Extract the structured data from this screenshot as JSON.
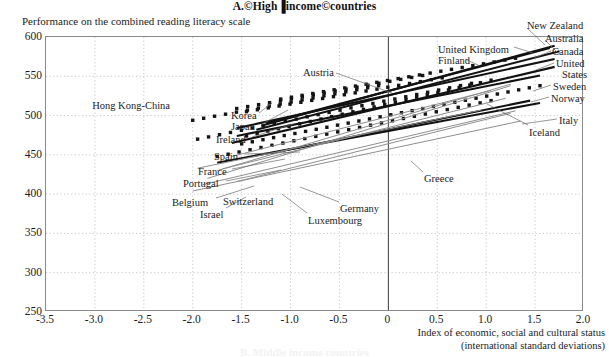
{
  "panel": {
    "title": "A.©High▐income©countries",
    "y_axis_caption": "Performance on the combined reading literacy scale",
    "x_axis_caption_line1": "Index of economic, social and cultural status",
    "x_axis_caption_line2": "(international standard deviations)",
    "next_panel_ghost": "B. Middle income countries"
  },
  "chart_data": {
    "type": "line",
    "title": "A.©High▐income©countries",
    "xlabel": "Index of economic, social and cultural status (international standard deviations)",
    "ylabel": "Performance on the combined reading literacy scale",
    "xlim": [
      -3.5,
      2.0
    ],
    "ylim": [
      250,
      600
    ],
    "xticks": [
      "-3.5",
      "-3.0",
      "-2.5",
      "-2.0",
      "-1.5",
      "-1.0",
      "-0.5",
      "0",
      "0.5",
      "1.0",
      "1.5",
      "2.0"
    ],
    "xtick_values": [
      -3.5,
      -3.0,
      -2.5,
      -2.0,
      -1.5,
      -1.0,
      -0.5,
      0,
      0.5,
      1.0,
      1.5,
      2.0
    ],
    "yticks": [
      "250",
      "300",
      "350",
      "400",
      "450",
      "500",
      "550",
      "600"
    ],
    "ytick_values": [
      250,
      300,
      350,
      400,
      450,
      500,
      550,
      600
    ],
    "grid": "dotted",
    "legend": "inline-annotations",
    "zero_reference_line_x": 0,
    "series": [
      {
        "name": "Hong Kong-China",
        "style": "dotted",
        "label_side": "left",
        "x": [
          -2.0,
          -0.1
        ],
        "y": [
          494,
          538
        ]
      },
      {
        "name": "Korea",
        "style": "dotted",
        "label_side": "left",
        "x": [
          -1.55,
          0.35
        ],
        "y": [
          509,
          551
        ]
      },
      {
        "name": "Japan",
        "style": "dotted",
        "label_side": "left",
        "x": [
          -1.45,
          0.55
        ],
        "y": [
          505,
          548
        ]
      },
      {
        "name": "Finland",
        "style": "dotted",
        "label_side": "mid",
        "x": [
          -1.1,
          1.3
        ],
        "y": [
          521,
          573
        ]
      },
      {
        "name": "Austria",
        "style": "dotted",
        "label_side": "mid",
        "x": [
          -1.95,
          0.85
        ],
        "y": [
          470,
          541
        ]
      },
      {
        "name": "Ireland",
        "style": "dotted",
        "label_side": "left",
        "x": [
          -1.45,
          1.05
        ],
        "y": [
          474,
          545
        ]
      },
      {
        "name": "Spain",
        "style": "dotted",
        "label_side": "left",
        "x": [
          -1.75,
          1.05
        ],
        "y": [
          448,
          519
        ]
      },
      {
        "name": "United Kingdom",
        "style": "solid",
        "label_side": "mid",
        "x": [
          -1.25,
          1.65
        ],
        "y": [
          490,
          586
        ]
      },
      {
        "name": "New Zealand",
        "style": "solid",
        "label_side": "right",
        "x": [
          -1.3,
          1.7
        ],
        "y": [
          487,
          589
        ]
      },
      {
        "name": "Australia",
        "style": "solid",
        "label_side": "right",
        "x": [
          -1.35,
          1.75
        ],
        "y": [
          482,
          582
        ]
      },
      {
        "name": "Canada",
        "style": "solid",
        "label_side": "right",
        "x": [
          -1.55,
          1.7
        ],
        "y": [
          484,
          572
        ]
      },
      {
        "name": "United States",
        "style": "solid",
        "label_side": "right",
        "x": [
          -1.6,
          1.7
        ],
        "y": [
          465,
          562
        ]
      },
      {
        "name": "Sweden",
        "style": "solid",
        "label_side": "right",
        "x": [
          -1.55,
          1.55
        ],
        "y": [
          474,
          551
        ]
      },
      {
        "name": "Norway",
        "style": "dotted",
        "label_side": "right",
        "x": [
          -1.5,
          1.55
        ],
        "y": [
          464,
          538
        ]
      },
      {
        "name": "Italy",
        "style": "solid",
        "label_side": "right",
        "x": [
          -1.75,
          1.55
        ],
        "y": [
          440,
          516
        ]
      },
      {
        "name": "Iceland",
        "style": "solid",
        "label_side": "right",
        "x": [
          -1.2,
          1.45
        ],
        "y": [
          452,
          519
        ]
      },
      {
        "name": "France",
        "style": "grey",
        "label_side": "left",
        "x": [
          -1.6,
          1.05
        ],
        "y": [
          448,
          532
        ]
      },
      {
        "name": "Portugal",
        "style": "grey",
        "label_side": "left",
        "x": [
          -1.95,
          0.95
        ],
        "y": [
          433,
          507
        ]
      },
      {
        "name": "Belgium",
        "style": "grey",
        "label_side": "left",
        "x": [
          -1.75,
          1.25
        ],
        "y": [
          430,
          540
        ]
      },
      {
        "name": "Switzerland",
        "style": "grey",
        "label_side": "mid",
        "x": [
          -1.7,
          1.2
        ],
        "y": [
          432,
          522
        ]
      },
      {
        "name": "Israel",
        "style": "grey",
        "label_side": "mid",
        "x": [
          -1.55,
          1.25
        ],
        "y": [
          416,
          503
        ]
      },
      {
        "name": "Germany",
        "style": "grey",
        "label_side": "mid",
        "x": [
          -1.85,
          1.25
        ],
        "y": [
          420,
          538
        ]
      },
      {
        "name": "Luxembourg",
        "style": "grey",
        "label_side": "mid",
        "x": [
          -1.9,
          1.3
        ],
        "y": [
          412,
          506
        ]
      },
      {
        "name": "Greece",
        "style": "grey",
        "label_side": "mid",
        "x": [
          -2.0,
          1.35
        ],
        "y": [
          404,
          493
        ]
      }
    ],
    "annotations": [
      {
        "label": "New Zealand",
        "x": 527,
        "y": 20,
        "side": "r",
        "lx1": 527,
        "ly1": 28,
        "lx2": 545,
        "ly2": 45
      },
      {
        "label": "Australia",
        "x": 545,
        "y": 33,
        "side": "r",
        "lx1": 545,
        "ly1": 40,
        "lx2": 557,
        "ly2": 52
      },
      {
        "label": "United Kingdom",
        "x": 438,
        "y": 44,
        "side": "r",
        "lx1": 514,
        "ly1": 47,
        "lx2": 533,
        "ly2": 53
      },
      {
        "label": "Canada",
        "x": 552,
        "y": 46,
        "side": "r",
        "lx1": 551,
        "ly1": 51,
        "lx2": 534,
        "ly2": 58
      },
      {
        "label": "Finland",
        "x": 438,
        "y": 55,
        "side": "r",
        "lx1": 465,
        "ly1": 59,
        "lx2": 480,
        "ly2": 66
      },
      {
        "label": "United",
        "x": 556,
        "y": 58,
        "side": "r",
        "lx1": 554,
        "ly1": 63,
        "lx2": 536,
        "ly2": 70
      },
      {
        "label": "States",
        "x": 562,
        "y": 69,
        "side": "r",
        "lx1": 0,
        "ly1": 0,
        "lx2": 0,
        "ly2": 0
      },
      {
        "label": "Austria",
        "x": 303,
        "y": 67,
        "side": "r",
        "lx1": 336,
        "ly1": 73,
        "lx2": 392,
        "ly2": 93
      },
      {
        "label": "Sweden",
        "x": 553,
        "y": 81,
        "side": "r",
        "lx1": 551,
        "ly1": 85,
        "lx2": 533,
        "ly2": 91
      },
      {
        "label": "Norway",
        "x": 551,
        "y": 93,
        "side": "r",
        "lx1": 549,
        "ly1": 97,
        "lx2": 531,
        "ly2": 102
      },
      {
        "label": "Hong Kong-China",
        "x": 170,
        "y": 100,
        "side": "l",
        "lx1": 0,
        "ly1": 0,
        "lx2": 0,
        "ly2": 0
      },
      {
        "label": "Italy",
        "x": 559,
        "y": 115,
        "side": "r",
        "lx1": 557,
        "ly1": 119,
        "lx2": 522,
        "ly2": 124
      },
      {
        "label": "Korea",
        "x": 231,
        "y": 110,
        "side": "r",
        "lx1": 259,
        "ly1": 113,
        "lx2": 272,
        "ly2": 103
      },
      {
        "label": "Japan",
        "x": 231,
        "y": 121,
        "side": "r",
        "lx1": 262,
        "ly1": 124,
        "lx2": 288,
        "ly2": 110
      },
      {
        "label": "Iceland",
        "x": 529,
        "y": 127,
        "side": "r",
        "lx1": 528,
        "ly1": 125,
        "lx2": 487,
        "ly2": 104
      },
      {
        "label": "Ireland",
        "x": 216,
        "y": 134,
        "side": "r",
        "lx1": 252,
        "ly1": 137,
        "lx2": 293,
        "ly2": 124
      },
      {
        "label": "Spain",
        "x": 214,
        "y": 151,
        "side": "r",
        "lx1": 245,
        "ly1": 154,
        "lx2": 300,
        "ly2": 152
      },
      {
        "label": "Greece",
        "x": 424,
        "y": 173,
        "side": "r",
        "lx1": 423,
        "ly1": 172,
        "lx2": 411,
        "ly2": 161
      },
      {
        "label": "France",
        "x": 198,
        "y": 166,
        "side": "r",
        "lx1": 232,
        "ly1": 169,
        "lx2": 285,
        "ly2": 159
      },
      {
        "label": "Portugal",
        "x": 183,
        "y": 178,
        "side": "r",
        "lx1": 226,
        "ly1": 181,
        "lx2": 281,
        "ly2": 170
      },
      {
        "label": "Belgium",
        "x": 172,
        "y": 197,
        "side": "r",
        "lx1": 216,
        "ly1": 198,
        "lx2": 254,
        "ly2": 186
      },
      {
        "label": "Switzerland",
        "x": 223,
        "y": 196,
        "side": "r",
        "lx1": 0,
        "ly1": 0,
        "lx2": 0,
        "ly2": 0
      },
      {
        "label": "Germany",
        "x": 340,
        "y": 203,
        "side": "r",
        "lx1": 339,
        "ly1": 202,
        "lx2": 300,
        "ly2": 187
      },
      {
        "label": "Israel",
        "x": 200,
        "y": 209,
        "side": "r",
        "lx1": 226,
        "ly1": 208,
        "lx2": 246,
        "ly2": 197
      },
      {
        "label": "Luxembourg",
        "x": 308,
        "y": 215,
        "side": "r",
        "lx1": 307,
        "ly1": 213,
        "lx2": 282,
        "ly2": 194
      }
    ]
  }
}
